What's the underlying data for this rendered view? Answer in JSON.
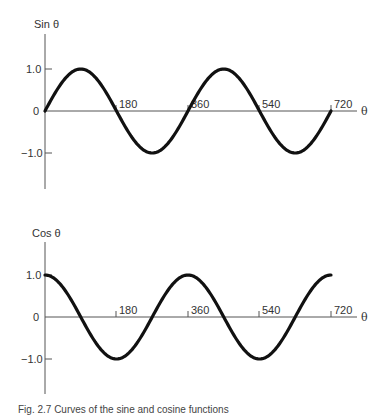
{
  "chart_data": [
    {
      "type": "line",
      "title": "Sin θ",
      "ylabel": "Sin θ",
      "xlabel": "θ",
      "x_ticks": [
        180,
        360,
        540,
        720
      ],
      "y_ticks": [
        "1.0",
        "0",
        "-1.0"
      ],
      "xlim": [
        0,
        720
      ],
      "ylim": [
        -1.6,
        1.6
      ],
      "grid": false,
      "series": [
        {
          "name": "sin θ",
          "x": [
            0,
            45,
            90,
            135,
            180,
            225,
            270,
            315,
            360,
            405,
            450,
            495,
            540,
            585,
            630,
            675,
            720
          ],
          "values": [
            0,
            0.71,
            1.0,
            0.71,
            0,
            -0.71,
            -1.0,
            -0.71,
            0,
            0.71,
            1.0,
            0.71,
            0,
            -0.71,
            -1.0,
            -0.71,
            0
          ]
        }
      ]
    },
    {
      "type": "line",
      "title": "Cos θ",
      "ylabel": "Cos θ",
      "xlabel": "θ",
      "x_ticks": [
        180,
        360,
        540,
        720
      ],
      "y_ticks": [
        "1.0",
        "0",
        "-1.0"
      ],
      "xlim": [
        0,
        720
      ],
      "ylim": [
        -1.6,
        1.6
      ],
      "grid": false,
      "series": [
        {
          "name": "cos θ",
          "x": [
            0,
            45,
            90,
            135,
            180,
            225,
            270,
            315,
            360,
            405,
            450,
            495,
            540,
            585,
            630,
            675,
            720
          ],
          "values": [
            1.0,
            0.71,
            0,
            -0.71,
            -1.0,
            -0.71,
            0,
            0.71,
            1.0,
            0.71,
            0,
            -0.71,
            -1.0,
            -0.71,
            0,
            0.71,
            1.0
          ]
        }
      ]
    }
  ],
  "labels": {
    "sin_axis": "Sin θ",
    "cos_axis": "Cos θ",
    "theta": "θ",
    "y_pos": "1.0",
    "y_zero": "0",
    "y_neg": "−1.0",
    "x180": "180",
    "x360": "360",
    "x540": "540",
    "x720": "720"
  },
  "caption": "Fig. 2.7 Curves of the sine and cosine functions"
}
